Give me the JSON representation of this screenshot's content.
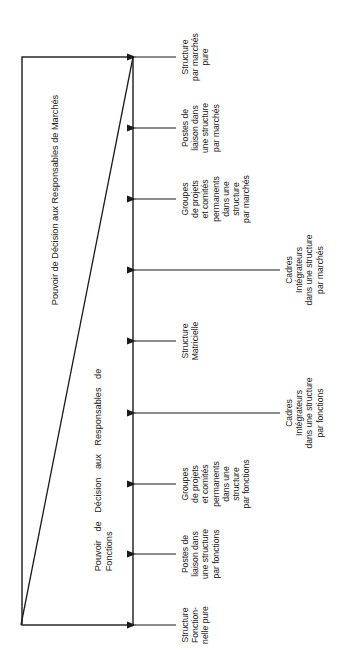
{
  "diagram": {
    "headings": {
      "markets": "Pouvoir de Décision aux Responsables de Marchés",
      "functions": "Pouvoir de Décision aux Responsables de\nFonctions"
    },
    "labels": [
      {
        "id": "structure-marches-pure",
        "text": "Structure\npar marchés\npure",
        "y": 57,
        "arrow": "short"
      },
      {
        "id": "postes-liaison-marches",
        "text": "Postes de\nliaison dans\nune structure\npar marchés",
        "y": 128,
        "arrow": "short"
      },
      {
        "id": "groupes-projets-marches",
        "text": "Groupes\nde projets\net comités\npermanents\ndans une\nstructure\npar marchés",
        "y": 199,
        "arrow": "short"
      },
      {
        "id": "cadres-integrateurs-marches",
        "text": "Cadres\nIntégrateurs\ndans une structure\npar marchés",
        "y": 270,
        "arrow": "long"
      },
      {
        "id": "structure-matricielle",
        "text": "Structure\nMatricielle",
        "y": 341,
        "arrow": "short"
      },
      {
        "id": "cadres-integrateurs-fonctions",
        "text": "Cadres\nIntégrateurs\ndans une structure\npar fonctions",
        "y": 413,
        "arrow": "long"
      },
      {
        "id": "groupes-projets-fonctions",
        "text": "Groupes\nde projets\net comités\npermanents\ndans une\nstructure\npar fonctions",
        "y": 484,
        "arrow": "short"
      },
      {
        "id": "postes-liaison-fonctions",
        "text": "Postes de\nliaison dans\nune structure\npar fonctions",
        "y": 554,
        "arrow": "short"
      },
      {
        "id": "structure-fonctionnelle-pure",
        "text": "Structure\nFonction-\nnelle pure",
        "y": 625,
        "arrow": "short"
      }
    ],
    "colors": {
      "line": "#1a1a1a",
      "background": "#ffffff"
    }
  }
}
